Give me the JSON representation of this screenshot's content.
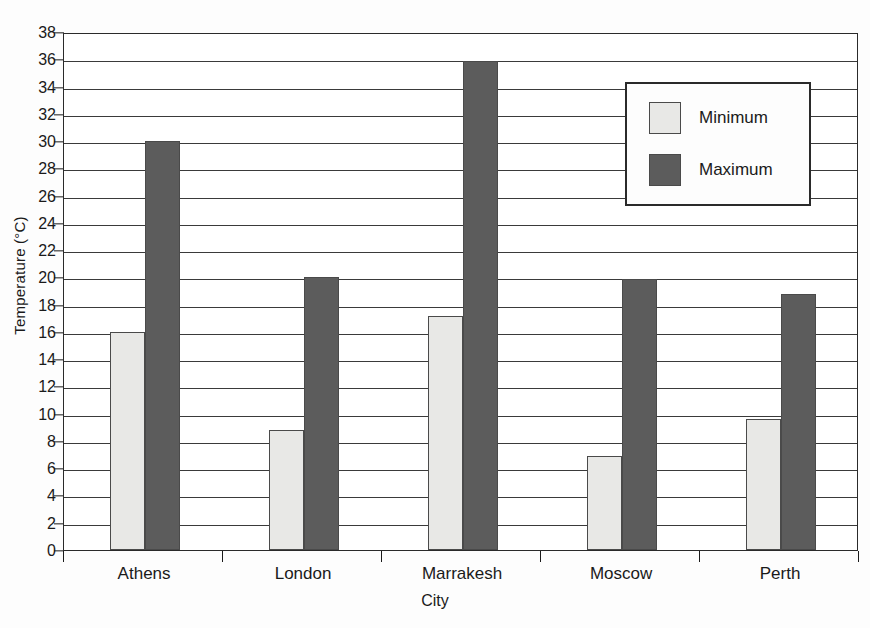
{
  "chart_data": {
    "type": "bar",
    "title": "",
    "xlabel": "City",
    "ylabel": "Temperature (°C)",
    "categories": [
      "Athens",
      "London",
      "Marrakesh",
      "Moscow",
      "Perth"
    ],
    "series": [
      {
        "name": "Minimum",
        "color": "#e8e8e6",
        "values": [
          16.0,
          8.8,
          17.2,
          6.9,
          9.6
        ]
      },
      {
        "name": "Maximum",
        "color": "#5c5c5c",
        "values": [
          30.0,
          20.0,
          35.9,
          19.9,
          18.8
        ]
      }
    ],
    "ylim": [
      0,
      38
    ],
    "ytick_step": 2,
    "yticks": [
      0,
      2,
      4,
      6,
      8,
      10,
      12,
      14,
      16,
      18,
      20,
      22,
      24,
      26,
      28,
      30,
      32,
      34,
      36,
      38
    ],
    "ytick_labels": [
      "0",
      "2",
      "4",
      "6",
      "8",
      "10",
      "12",
      "14",
      "16",
      "18",
      "20",
      "22",
      "24",
      "26",
      "28",
      "30",
      "32",
      "34",
      "36",
      "38"
    ],
    "grid": true,
    "grid_axis": "y",
    "legend_position": "upper right",
    "legend_entries": [
      "Minimum",
      "Maximum"
    ]
  },
  "legend": {
    "entries": [
      {
        "label": "Minimum"
      },
      {
        "label": "Maximum"
      }
    ]
  },
  "axes": {
    "y_title": "Temperature (°C)",
    "x_title": "City"
  },
  "colors": {
    "minimum_fill": "#e8e8e6",
    "maximum_fill": "#5c5c5c",
    "axis": "#1a1a1a",
    "gridline": "#3a3a3a",
    "plot_background": "#ffffff",
    "page_background": "#fdfdfd"
  }
}
